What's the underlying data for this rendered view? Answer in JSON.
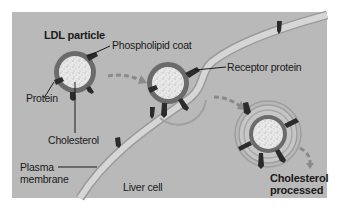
{
  "diagram": {
    "type": "biology-illustration",
    "colors": {
      "panel_bg": "#b9b9b9",
      "page_bg": "#ffffff",
      "membrane": "#d2d2d2",
      "membrane_edge": "#9a9a9a",
      "particle_coat": "#6b6b6b",
      "particle_core": "#e6e6e6",
      "protein": "#2b2b2b",
      "arrow": "#8a8a8a",
      "text": "#1a1a1a"
    },
    "labels": {
      "ldl_particle": "LDL particle",
      "phospholipid_coat": "Phospholipid coat",
      "protein": "Protein",
      "cholesterol": "Cholesterol",
      "receptor_protein": "Receptor protein",
      "plasma_membrane": "Plasma\nmembrane",
      "liver_cell": "Liver cell",
      "cholesterol_processed": "Cholesterol\nprocessed"
    },
    "stages": [
      {
        "name": "free-ldl-particle",
        "description": "LDL particle outside cell"
      },
      {
        "name": "bound-ldl-particle",
        "description": "LDL bound to receptor protein in membrane"
      },
      {
        "name": "internalized-ldl-particle",
        "description": "LDL enclosed in vesicle inside liver cell"
      }
    ]
  }
}
